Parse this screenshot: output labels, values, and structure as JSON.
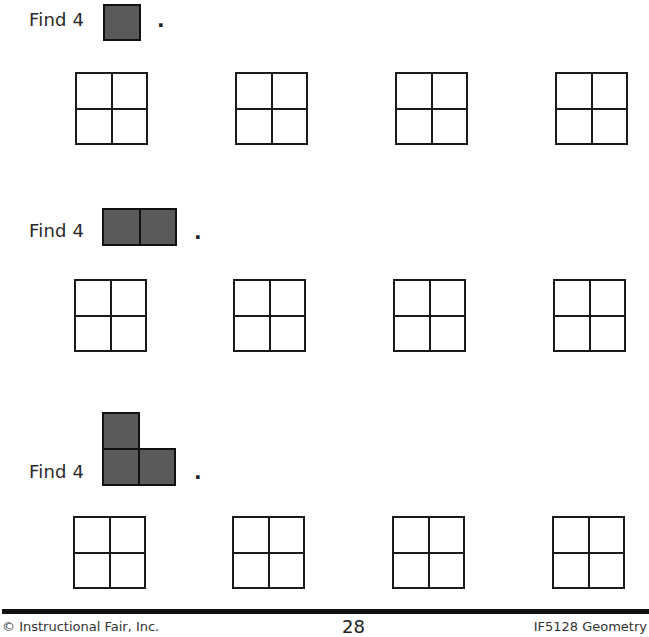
{
  "sections": [
    {
      "prompt": "Find 4",
      "period": ".",
      "shape": "monomino",
      "shape_cells": 1,
      "grid_count": 4
    },
    {
      "prompt": "Find 4",
      "period": ".",
      "shape": "domino",
      "shape_cells": 2,
      "grid_count": 4
    },
    {
      "prompt": "Find 4",
      "period": ".",
      "shape": "L-tromino",
      "shape_cells": 3,
      "grid_count": 4
    }
  ],
  "grid": {
    "rows": 2,
    "cols": 2
  },
  "colors": {
    "shape_fill": "#5a5a5a",
    "line": "#1a1a1a",
    "background": "#ffffff"
  },
  "footer": {
    "copyright": "© Instructional Fair, Inc.",
    "page_number": "28",
    "product": "IF5128 Geometry"
  }
}
